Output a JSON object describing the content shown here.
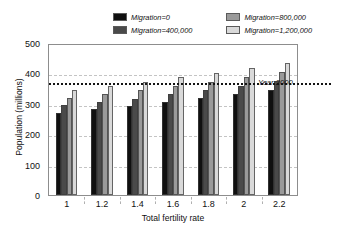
{
  "chart_data": {
    "type": "bar",
    "title": "",
    "xlabel": "Total fertility rate",
    "ylabel": "Population (millions)",
    "categories": [
      "1",
      "1.2",
      "1.4",
      "1.6",
      "1.8",
      "2",
      "2.2"
    ],
    "series": [
      {
        "name": "Migration=0",
        "color": "#101010",
        "values": [
          270,
          282,
          292,
          305,
          318,
          331,
          345
        ]
      },
      {
        "name": "Migration=400,000",
        "color": "#4a4a4a",
        "values": [
          295,
          306,
          317,
          331,
          345,
          358,
          374
        ]
      },
      {
        "name": "Migration=800,000",
        "color": "#9a9a9a",
        "values": [
          320,
          332,
          345,
          358,
          373,
          389,
          405
        ]
      },
      {
        "name": "Migration=1,200,000",
        "color": "#d9d9d9",
        "values": [
          344,
          358,
          373,
          388,
          402,
          418,
          434
        ]
      }
    ],
    "ylim": [
      0,
      500
    ],
    "yticks": [
      0,
      100,
      200,
      300,
      400,
      500
    ],
    "grid": true,
    "legend_position": "top",
    "annotations": [
      {
        "name": "year-2000-reference",
        "label": "Year 2000",
        "value": 375,
        "style": "dotted-horizontal-line"
      }
    ]
  }
}
